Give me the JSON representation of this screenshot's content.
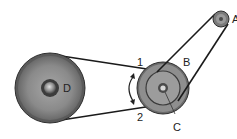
{
  "diagram": {
    "type": "belt-pulley-drive",
    "labels": {
      "pulley_a": "A",
      "pulley_b": "B",
      "pulley_c": "C",
      "pulley_d": "D",
      "belt_span_1": "1",
      "belt_span_2": "2"
    },
    "colors": {
      "belt": "#1a1a1a",
      "pulley_rim": "#6e6e6e",
      "pulley_face": "#8c8c8c",
      "pulley_edge": "#3a3a3a",
      "background": "#ffffff"
    }
  }
}
